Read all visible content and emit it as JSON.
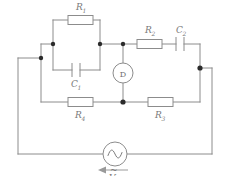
{
  "diagram": {
    "type": "schematic",
    "colors": {
      "wire": "#8c8c8c",
      "node": "#2b2b2b",
      "label": "#7a7a7a",
      "background": "#ffffff"
    },
    "components": [
      {
        "id": "R1",
        "kind": "resistor",
        "base": "R",
        "subscript": "1",
        "label": "R1",
        "position": "top-left-branch-upper"
      },
      {
        "id": "C1",
        "kind": "capacitor",
        "base": "C",
        "subscript": "1",
        "label": "C1",
        "position": "top-left-branch-lower"
      },
      {
        "id": "R2",
        "kind": "resistor",
        "base": "R",
        "subscript": "2",
        "label": "R2",
        "position": "top-right-arm"
      },
      {
        "id": "C2",
        "kind": "capacitor",
        "base": "C",
        "subscript": "2",
        "label": "C2",
        "position": "top-right-arm"
      },
      {
        "id": "R4",
        "kind": "resistor",
        "base": "R",
        "subscript": "4",
        "label": "R4",
        "position": "bottom-left-arm"
      },
      {
        "id": "R3",
        "kind": "resistor",
        "base": "R",
        "subscript": "3",
        "label": "R3",
        "position": "bottom-right-arm"
      },
      {
        "id": "D",
        "kind": "detector",
        "base": "D",
        "subscript": "",
        "label": "D",
        "position": "bridge-center"
      },
      {
        "id": "V",
        "kind": "ac-source",
        "base": "V",
        "subscript": "",
        "label": "V",
        "accent": "tilde",
        "position": "bottom-center"
      }
    ],
    "source": {
      "symbol": "sine-wave",
      "label_base": "V",
      "label_accent": "~",
      "arrow_direction": "left"
    },
    "detector": {
      "letter": "D"
    }
  }
}
